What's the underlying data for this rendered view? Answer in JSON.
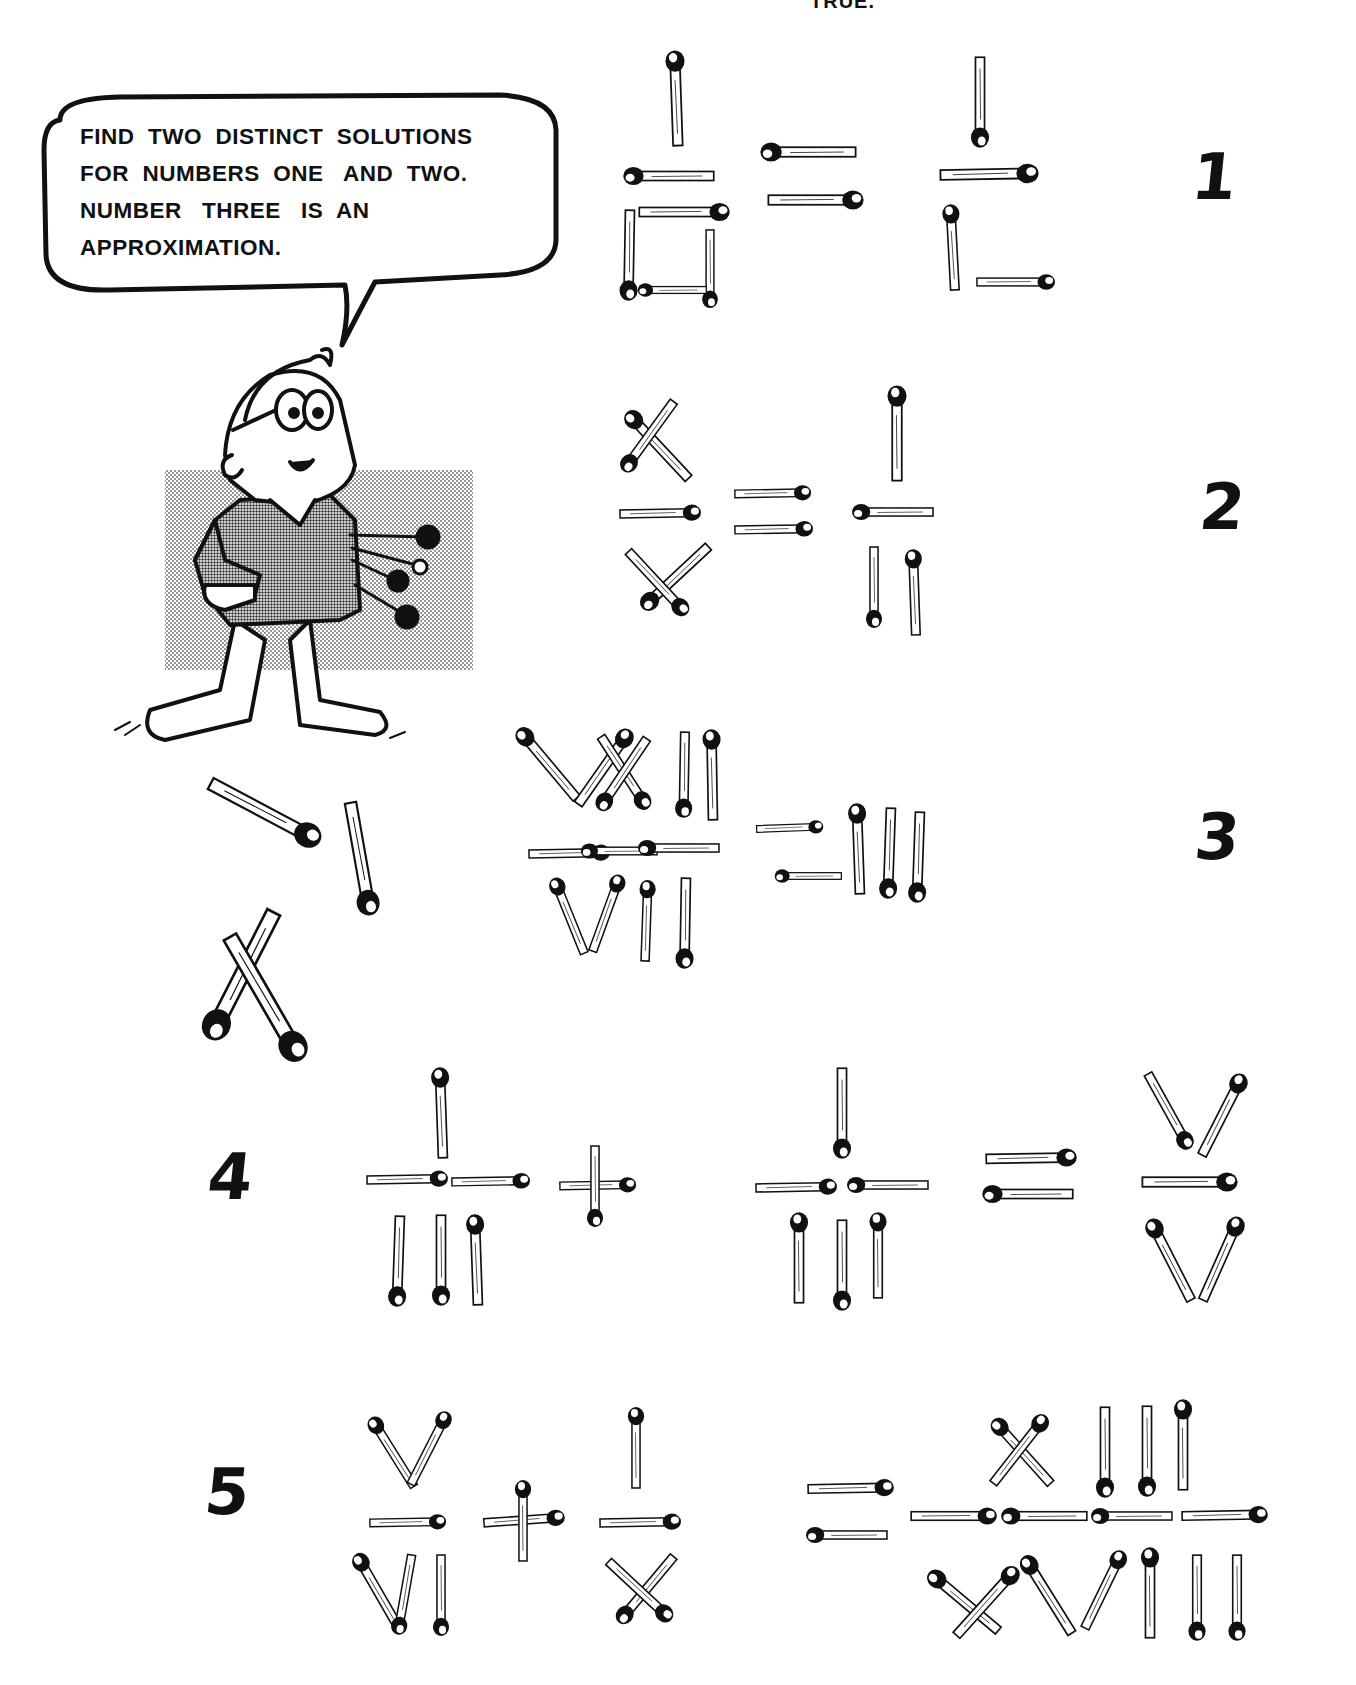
{
  "page": {
    "top_caption": "TRUE.",
    "speech_bubble": {
      "text": "FIND  TWO  DISTINCT  SOLUTIONS\nFOR  NUMBERS  ONE   AND  TWO.\nNUMBER   THREE   IS  AN\nAPPROXIMATION."
    },
    "illustration": {
      "character": "cartoon boy with glasses holding matchsticks behind his back",
      "background": "halftone gray rectangle"
    },
    "loose_matches": [
      "match-1",
      "match-2",
      "match-crossed-pair"
    ]
  },
  "puzzles": [
    {
      "label": "1",
      "equation": "I/□ = I/L",
      "description": "matchstick fraction with square denominator equals fraction with L-shaped denominator"
    },
    {
      "label": "2",
      "equation": "X/X = I/II"
    },
    {
      "label": "3",
      "equation": "XXII/VII = III"
    },
    {
      "label": "4",
      "equation": "I/III + I/III = V/V"
    },
    {
      "label": "5",
      "equation": "V/VI + I/X = XIII/XVIII"
    }
  ],
  "colors": {
    "ink": "#111111",
    "paper": "#ffffff",
    "halftone": "#bdbdbd"
  }
}
